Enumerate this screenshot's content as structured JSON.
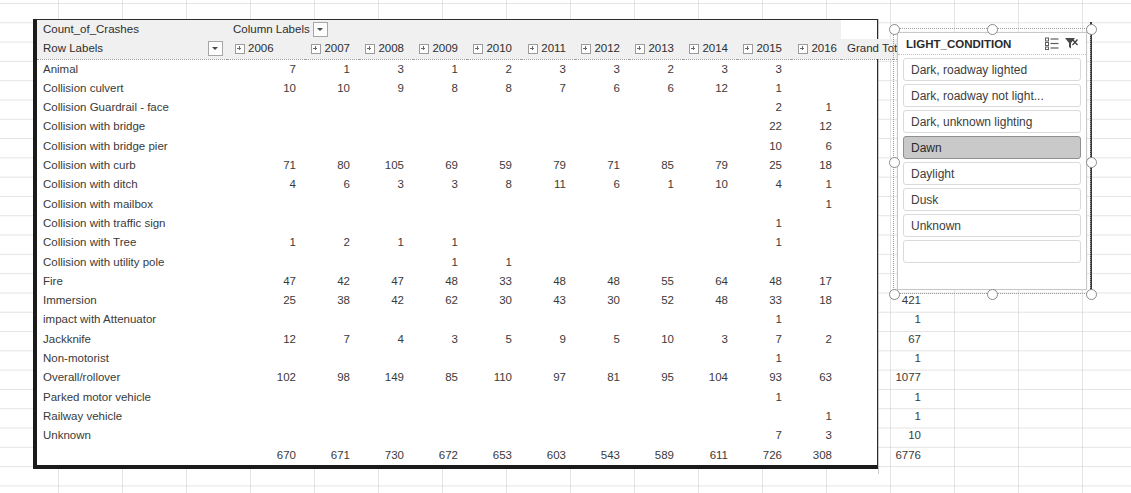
{
  "pivot": {
    "value_field_label": "Count_of_Crashes",
    "column_labels_header": "Column Labels",
    "row_labels_header": "Row Labels",
    "grand_total_header": "Grand Total",
    "years": [
      "2006",
      "2007",
      "2008",
      "2009",
      "2010",
      "2011",
      "2012",
      "2013",
      "2014",
      "2015",
      "2016"
    ],
    "rows": [
      {
        "label": "Animal",
        "values": [
          "7",
          "1",
          "3",
          "1",
          "2",
          "3",
          "3",
          "2",
          "3",
          "3",
          ""
        ],
        "total": "28"
      },
      {
        "label": "Collision culvert",
        "values": [
          "10",
          "10",
          "9",
          "8",
          "8",
          "7",
          "6",
          "6",
          "12",
          "1",
          ""
        ],
        "total": "77"
      },
      {
        "label": "Collision Guardrail - face",
        "values": [
          "",
          "",
          "",
          "",
          "",
          "",
          "",
          "",
          "",
          "2",
          "1"
        ],
        "total": "3"
      },
      {
        "label": "Collision with bridge",
        "values": [
          "",
          "",
          "",
          "",
          "",
          "",
          "",
          "",
          "",
          "22",
          "12"
        ],
        "total": "34"
      },
      {
        "label": "Collision with bridge pier",
        "values": [
          "",
          "",
          "",
          "",
          "",
          "",
          "",
          "",
          "",
          "10",
          "6"
        ],
        "total": "16"
      },
      {
        "label": "Collision with curb",
        "values": [
          "71",
          "80",
          "105",
          "69",
          "59",
          "79",
          "71",
          "85",
          "79",
          "25",
          "18"
        ],
        "total": "741"
      },
      {
        "label": "Collision with ditch",
        "values": [
          "4",
          "6",
          "3",
          "3",
          "8",
          "11",
          "6",
          "1",
          "10",
          "4",
          "1"
        ],
        "total": "57"
      },
      {
        "label": "Collision with mailbox",
        "values": [
          "",
          "",
          "",
          "",
          "",
          "",
          "",
          "",
          "",
          "",
          "1"
        ],
        "total": "1"
      },
      {
        "label": "Collision with traffic sign",
        "values": [
          "",
          "",
          "",
          "",
          "",
          "",
          "",
          "",
          "",
          "1",
          ""
        ],
        "total": "1"
      },
      {
        "label": "Collision with Tree",
        "values": [
          "1",
          "2",
          "1",
          "1",
          "",
          "",
          "",
          "",
          "",
          "1",
          ""
        ],
        "total": "6"
      },
      {
        "label": "Collision with utility pole",
        "values": [
          "",
          "",
          "",
          "1",
          "1",
          "",
          "",
          "",
          "",
          "",
          ""
        ],
        "total": "2"
      },
      {
        "label": "Fire",
        "values": [
          "47",
          "42",
          "47",
          "48",
          "33",
          "48",
          "48",
          "55",
          "64",
          "48",
          "17"
        ],
        "total": "497"
      },
      {
        "label": "Immersion",
        "values": [
          "25",
          "38",
          "42",
          "62",
          "30",
          "43",
          "30",
          "52",
          "48",
          "33",
          "18"
        ],
        "total": "421"
      },
      {
        "label": "impact with Attenuator",
        "values": [
          "",
          "",
          "",
          "",
          "",
          "",
          "",
          "",
          "",
          "1",
          ""
        ],
        "total": "1"
      },
      {
        "label": "Jackknife",
        "values": [
          "12",
          "7",
          "4",
          "3",
          "5",
          "9",
          "5",
          "10",
          "3",
          "7",
          "2"
        ],
        "total": "67"
      },
      {
        "label": "Non-motorist",
        "values": [
          "",
          "",
          "",
          "",
          "",
          "",
          "",
          "",
          "",
          "1",
          ""
        ],
        "total": "1"
      },
      {
        "label": "Overall/rollover",
        "values": [
          "102",
          "98",
          "149",
          "85",
          "110",
          "97",
          "81",
          "95",
          "104",
          "93",
          "63"
        ],
        "total": "1077"
      },
      {
        "label": "Parked motor vehicle",
        "values": [
          "",
          "",
          "",
          "",
          "",
          "",
          "",
          "",
          "",
          "1",
          ""
        ],
        "total": "1"
      },
      {
        "label": "Railway vehicle",
        "values": [
          "",
          "",
          "",
          "",
          "",
          "",
          "",
          "",
          "",
          "",
          "1"
        ],
        "total": "1"
      },
      {
        "label": "Unknown",
        "values": [
          "",
          "",
          "",
          "",
          "",
          "",
          "",
          "",
          "",
          "7",
          "3"
        ],
        "total": "10"
      }
    ],
    "grand_total_row": {
      "label": "",
      "values": [
        "670",
        "671",
        "730",
        "672",
        "653",
        "603",
        "543",
        "589",
        "611",
        "726",
        "308"
      ],
      "total": "6776"
    }
  },
  "slicer": {
    "title": "LIGHT_CONDITION",
    "multi_select_icon": "multi-select-icon",
    "clear_filter_icon": "clear-filter-icon",
    "items": [
      {
        "label": "Dark, roadway lighted",
        "selected": false
      },
      {
        "label": "Dark, roadway not light...",
        "selected": false
      },
      {
        "label": "Dark, unknown lighting",
        "selected": false
      },
      {
        "label": "Dawn",
        "selected": true
      },
      {
        "label": "Daylight",
        "selected": false
      },
      {
        "label": "Dusk",
        "selected": false
      },
      {
        "label": "Unknown",
        "selected": false
      },
      {
        "label": "",
        "selected": false
      }
    ]
  },
  "colors": {
    "header_bg": "#f0f0f0",
    "selected_item_bg": "#c9c9c9",
    "text": "#3a3a3a",
    "border_dark": "#1b1b1b"
  }
}
